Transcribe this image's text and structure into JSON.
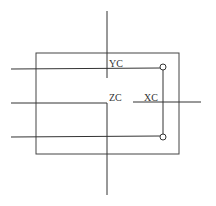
{
  "diagram": {
    "labels": {
      "yc": "YC",
      "zc": "ZC",
      "xc": "XC"
    },
    "colors": {
      "stroke": "#333333",
      "background": "#ffffff"
    }
  }
}
